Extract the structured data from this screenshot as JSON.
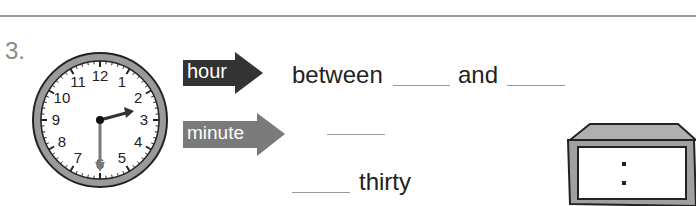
{
  "question": {
    "number": "3."
  },
  "clock": {
    "type": "analog",
    "numbers": [
      "12",
      "1",
      "2",
      "3",
      "4",
      "5",
      "6",
      "7",
      "8",
      "9",
      "10",
      "11"
    ],
    "time_shown": "2:30",
    "hour_hand_color": "#333333",
    "minute_hand_color": "#7a7a7a",
    "rim_color": "#9a9a9a"
  },
  "arrows": {
    "hour": {
      "label": "hour",
      "color": "#333333"
    },
    "minute": {
      "label": "minute",
      "color": "#7a7a7a"
    }
  },
  "prompts": {
    "hour_line": {
      "before": "between",
      "middle": "and"
    },
    "minute_line": {
      "blank": ""
    },
    "answer_line": {
      "after": "thirty"
    }
  },
  "digital_clock": {
    "separator": ":",
    "frame_color": "#a0a0a0"
  }
}
